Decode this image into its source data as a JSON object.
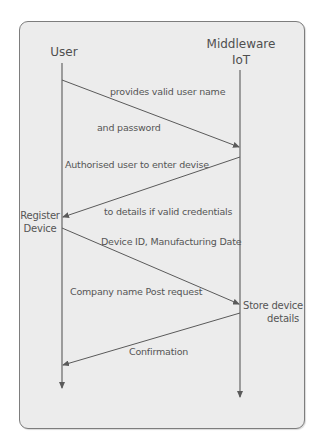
{
  "actors": {
    "user": "User",
    "middleware_line1": "Middleware",
    "middleware_line2": "IoT"
  },
  "states": {
    "register_line1": "Register",
    "register_line2": "Device",
    "store_line1": "Store device",
    "store_line2": "details"
  },
  "messages": [
    {
      "text": "provides valid user name",
      "from": "User",
      "to": "Middleware IoT"
    },
    {
      "text": "and password",
      "from": "User",
      "to": "Middleware IoT"
    },
    {
      "text": "Authorised user to enter devise",
      "from": "Middleware IoT",
      "to": "User"
    },
    {
      "text": "to details if valid credentials",
      "from": "Middleware IoT",
      "to": "User"
    },
    {
      "text": "Device ID, Manufacturing Date",
      "from": "User",
      "to": "Middleware IoT"
    },
    {
      "text": "Company name Post request",
      "from": "User",
      "to": "Middleware IoT"
    },
    {
      "text": "Confirmation",
      "from": "Middleware IoT",
      "to": "User"
    }
  ],
  "colors": {
    "background": "#ececec",
    "line": "#5a5a5a",
    "text": "#555555"
  }
}
